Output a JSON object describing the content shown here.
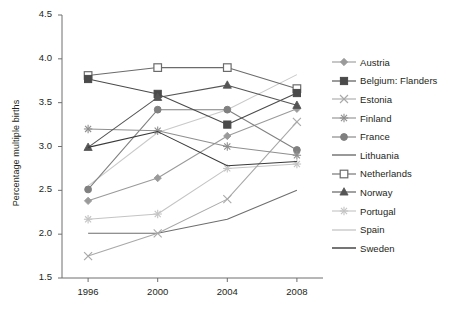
{
  "chart_data": {
    "type": "line",
    "title": "",
    "xlabel": "",
    "ylabel": "Percentage multiple births",
    "categories": [
      "1996",
      "2000",
      "2004",
      "2008"
    ],
    "x": [
      1996,
      2000,
      2004,
      2008
    ],
    "xlim": [
      1994.5,
      2009.5
    ],
    "ylim": [
      1.5,
      4.5
    ],
    "yticks": [
      "1.5",
      "2.0",
      "2.5",
      "3.0",
      "3.5",
      "4.0",
      "4.5"
    ],
    "ytick_values": [
      1.5,
      2.0,
      2.5,
      3.0,
      3.5,
      4.0,
      4.5
    ],
    "grid": false,
    "legend_position": "right",
    "series": [
      {
        "name": "Austria",
        "marker": "diamond",
        "color": "#9a9a9a",
        "values": [
          2.38,
          2.64,
          3.12,
          3.43
        ]
      },
      {
        "name": "Belgium: Flanders",
        "marker": "square-filled",
        "color": "#4a4a4a",
        "values": [
          3.77,
          3.6,
          3.25,
          3.61
        ]
      },
      {
        "name": "Estonia",
        "marker": "cross",
        "color": "#a8a8a8",
        "values": [
          1.75,
          2.01,
          2.4,
          3.28
        ]
      },
      {
        "name": "Finland",
        "marker": "asterisk",
        "color": "#8f8f8f",
        "values": [
          3.2,
          3.18,
          3.0,
          2.9
        ]
      },
      {
        "name": "France",
        "marker": "circle-filled",
        "color": "#808080",
        "values": [
          2.51,
          3.42,
          3.42,
          2.96
        ]
      },
      {
        "name": "Lithuania",
        "marker": "none",
        "color": "#6e6e6e",
        "values": [
          2.01,
          2.01,
          2.17,
          2.5
        ]
      },
      {
        "name": "Netherlands",
        "marker": "square-open",
        "color": "#6b6b6b",
        "values": [
          3.81,
          3.9,
          3.9,
          3.66
        ]
      },
      {
        "name": "Norway",
        "marker": "triangle-filled",
        "color": "#555555",
        "values": [
          2.99,
          3.56,
          3.7,
          3.47
        ]
      },
      {
        "name": "Portugal",
        "marker": "asterisk",
        "color": "#c4c4c4",
        "values": [
          2.17,
          2.23,
          2.75,
          2.8
        ]
      },
      {
        "name": "Spain",
        "marker": "none",
        "color": "#c9c9c9",
        "values": [
          2.55,
          3.16,
          3.42,
          3.82
        ]
      },
      {
        "name": "Sweden",
        "marker": "none",
        "color": "#3a3a3a",
        "values": [
          2.99,
          3.17,
          2.78,
          2.83
        ]
      }
    ]
  }
}
